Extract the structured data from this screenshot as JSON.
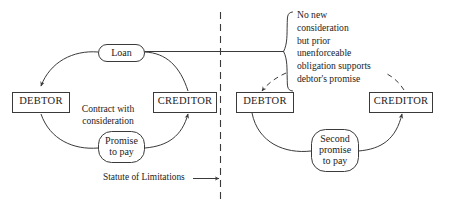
{
  "figure": {
    "stroke_color": "#3a3a3a",
    "text_color": "#1c1c1c",
    "background_color": "#ffffff"
  },
  "left_panel": {
    "name": "contract-with-consideration-panel",
    "debtor_box": {
      "label": "DEBTOR"
    },
    "creditor_box": {
      "label": "CREDITOR"
    },
    "top_oval": {
      "label": "Loan"
    },
    "bottom_oval": {
      "label": "Promise\nto pay"
    },
    "center_note": {
      "label": "Contract with\nconsideration"
    }
  },
  "divider": {
    "name": "statute-of-limitations-divider",
    "style": "dashed-vertical",
    "label": "Statute of Limitations"
  },
  "right_panel": {
    "name": "second-promise-panel",
    "debtor_box": {
      "label": "DEBTOR"
    },
    "creditor_box": {
      "label": "CREDITOR"
    },
    "bottom_oval": {
      "label": "Second\npromise\nto pay"
    },
    "brace_note": {
      "label": "No new\nconsideration\nbut prior\nunenforceable\nobligation supports\ndebtor's promise"
    }
  }
}
